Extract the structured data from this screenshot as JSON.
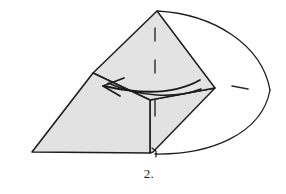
{
  "figure": {
    "caption": "2.",
    "title": "Origami fold step 2 diagram",
    "colors": {
      "paper_fill": "#e2e2e2",
      "paper_fill_light": "#e6e6e6",
      "outline": "#1d1d1d",
      "background": "#ffffff",
      "crease_line": "#2a2a2a",
      "arrow": "#1a1a1a"
    },
    "shapes": {
      "left_flap": {
        "name": "left-folded-flap",
        "points": "32,152 93,73 150,100 150,153"
      },
      "upper_point": {
        "name": "upper-standing-point",
        "points": "157,11 215,88 150,100 93,73"
      },
      "lower_right_panel": {
        "name": "lower-right-panel",
        "points": "150,100 215,88 153,152 150,153"
      }
    },
    "ellipse": {
      "name": "round-paper-sheet",
      "top_arc": "M157,11 C214,14 262,45 270,90",
      "bottom_arc": "M270,90 C262,134 210,155 155,154"
    },
    "creases": [
      {
        "name": "crease-dash-top",
        "x1": 155,
        "y1": 28,
        "x2": 155,
        "y2": 41
      },
      {
        "name": "crease-dash-middle",
        "x1": 155,
        "y1": 60,
        "x2": 155,
        "y2": 73
      },
      {
        "name": "crease-dash-bottom",
        "x1": 155,
        "y1": 100,
        "x2": 155,
        "y2": 116
      },
      {
        "name": "crease-dash-right",
        "x1": 232,
        "y1": 86,
        "x2": 248,
        "y2": 89
      }
    ],
    "fold_edge": {
      "name": "horizontal-fold-edge",
      "path": "M108,83 C140,97 175,99 201,89"
    },
    "notch": {
      "name": "bottom-notch-tick",
      "path": "M152,148 L156,151 L156,157"
    },
    "arrow": {
      "name": "fold-direction-arrow",
      "label": "fold left",
      "shaft": "M200,80 C170,97 130,92 104,86",
      "head_upper": "M103,86 L124,78",
      "head_lower": "M103,86 L120,96"
    }
  }
}
